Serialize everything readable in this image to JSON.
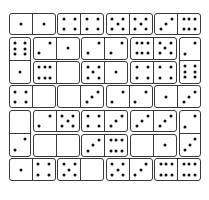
{
  "puzzle": {
    "type": "domino-grid",
    "grid": {
      "cols": 8,
      "rows": 7,
      "cell_px": 24.3,
      "origin": [
        8,
        12
      ]
    },
    "colors": {
      "border": "#3a3a3a",
      "pip": "#111111",
      "background": "#ffffff"
    },
    "dominoes": [
      {
        "col": 0,
        "row": 0,
        "orient": "h",
        "a": 1,
        "b": 1
      },
      {
        "col": 2,
        "row": 0,
        "orient": "h",
        "a": 4,
        "b": 4
      },
      {
        "col": 4,
        "row": 0,
        "orient": "h",
        "a": 5,
        "b": 5
      },
      {
        "col": 6,
        "row": 0,
        "orient": "h",
        "a": 3,
        "b": 6
      },
      {
        "col": 0,
        "row": 1,
        "orient": "v",
        "a": 6,
        "b": 1
      },
      {
        "col": 1,
        "row": 1,
        "orient": "h",
        "a": 2,
        "b": 1
      },
      {
        "col": 3,
        "row": 1,
        "orient": "h",
        "a": 2,
        "b": 2
      },
      {
        "col": 5,
        "row": 1,
        "orient": "h",
        "a": 6,
        "b": 5
      },
      {
        "col": 7,
        "row": 1,
        "orient": "v",
        "a": 2,
        "b": 6
      },
      {
        "col": 1,
        "row": 2,
        "orient": "h",
        "a": 6,
        "b": 0
      },
      {
        "col": 3,
        "row": 2,
        "orient": "h",
        "a": 5,
        "b": 1
      },
      {
        "col": 5,
        "row": 2,
        "orient": "h",
        "a": 4,
        "b": 4
      },
      {
        "col": 0,
        "row": 3,
        "orient": "h",
        "a": 4,
        "b": 0
      },
      {
        "col": 2,
        "row": 3,
        "orient": "h",
        "a": 0,
        "b": 3
      },
      {
        "col": 4,
        "row": 3,
        "orient": "h",
        "a": 2,
        "b": 2
      },
      {
        "col": 6,
        "row": 3,
        "orient": "h",
        "a": 1,
        "b": 3
      },
      {
        "col": 0,
        "row": 4,
        "orient": "v",
        "a": 0,
        "b": 2
      },
      {
        "col": 1,
        "row": 4,
        "orient": "h",
        "a": 2,
        "b": 5
      },
      {
        "col": 3,
        "row": 4,
        "orient": "h",
        "a": 4,
        "b": 3
      },
      {
        "col": 5,
        "row": 4,
        "orient": "h",
        "a": 3,
        "b": 3
      },
      {
        "col": 7,
        "row": 4,
        "orient": "v",
        "a": 2,
        "b": 3
      },
      {
        "col": 1,
        "row": 5,
        "orient": "h",
        "a": 0,
        "b": 0
      },
      {
        "col": 3,
        "row": 5,
        "orient": "h",
        "a": 3,
        "b": 6
      },
      {
        "col": 5,
        "row": 5,
        "orient": "h",
        "a": 0,
        "b": 1
      },
      {
        "col": 0,
        "row": 6,
        "orient": "h",
        "a": 1,
        "b": 4
      },
      {
        "col": 2,
        "row": 6,
        "orient": "h",
        "a": 5,
        "b": 0
      },
      {
        "col": 4,
        "row": 6,
        "orient": "h",
        "a": 5,
        "b": 3
      },
      {
        "col": 6,
        "row": 6,
        "orient": "h",
        "a": 6,
        "b": 6
      }
    ]
  }
}
